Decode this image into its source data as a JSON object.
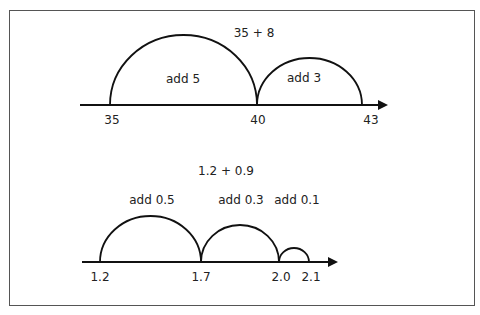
{
  "diagrams": [
    {
      "title": "35 + 8",
      "ticks": [
        {
          "label": "35",
          "x": 110
        },
        {
          "label": "40",
          "x": 257
        },
        {
          "label": "43",
          "x": 362
        }
      ],
      "jumps": [
        {
          "label": "add 5",
          "from": "35",
          "to": "40"
        },
        {
          "label": "add 3",
          "from": "40",
          "to": "43"
        }
      ]
    },
    {
      "title": "1.2 + 0.9",
      "ticks": [
        {
          "label": "1.2",
          "x": 100
        },
        {
          "label": "1.7",
          "x": 201
        },
        {
          "label": "2.0",
          "x": 279
        },
        {
          "label": "2.1",
          "x": 309
        }
      ],
      "jumps": [
        {
          "label": "add 0.5",
          "from": "1.2",
          "to": "1.7"
        },
        {
          "label": "add 0.3",
          "from": "1.7",
          "to": "2.0"
        },
        {
          "label": "add 0.1",
          "from": "2.0",
          "to": "2.1"
        }
      ]
    }
  ],
  "colors": {
    "line": "#111111",
    "frame": "#555555",
    "text": "#222222"
  }
}
